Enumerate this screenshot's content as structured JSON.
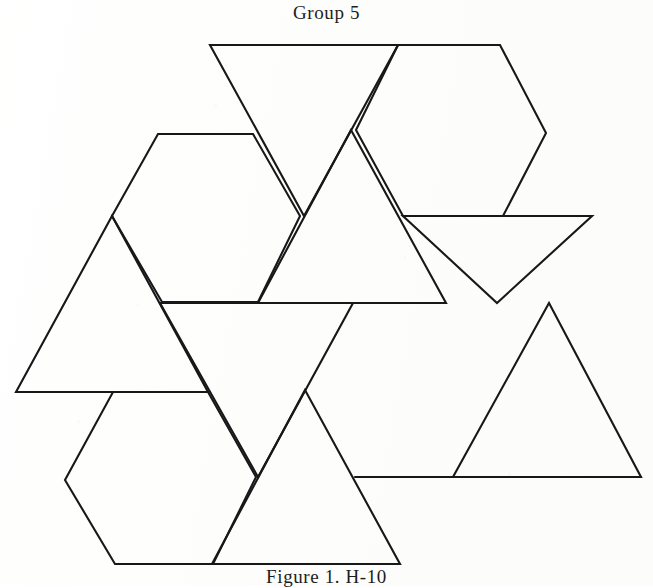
{
  "figure": {
    "title": "Group 5",
    "caption": "Figure 1. H-10",
    "caption_note": "caption clipped by bottom edge of page",
    "ink_color": "#18181a",
    "paper_color": "#fdfdfc"
  },
  "net": {
    "description": "polyhedron net of equilateral triangles and regular hexagons",
    "shape_counts": {
      "triangles": 7,
      "hexagons": 3
    },
    "faces": [
      {
        "name": "triangle-top-left-down",
        "kind": "triangle",
        "orientation": "down",
        "points": "210,45 398,45 304,216"
      },
      {
        "name": "hexagon-top-right",
        "kind": "hexagon",
        "points": "398,45 500,45 546,133 503,216 403,216 356,130"
      },
      {
        "name": "hexagon-left",
        "kind": "hexagon",
        "points": "158,134 253,134 300,216 258,302 162,302 112,216"
      },
      {
        "name": "triangle-left-up",
        "kind": "triangle",
        "orientation": "up",
        "points": "112,216 208,392 16,392"
      },
      {
        "name": "triangle-center-up",
        "kind": "triangle",
        "orientation": "up",
        "points": "351,130 446,303 258,303"
      },
      {
        "name": "triangle-right-down",
        "kind": "triangle",
        "orientation": "down",
        "points": "403,216 592,216 497,303"
      },
      {
        "name": "triangle-center-low-down",
        "kind": "triangle",
        "orientation": "down",
        "points": "160,303 353,303 258,477"
      },
      {
        "name": "triangle-right-low-up",
        "kind": "triangle",
        "orientation": "up",
        "points": "549,303 641,477 453,477"
      },
      {
        "name": "hexagon-bottom-left",
        "kind": "hexagon",
        "points": "113,392 208,392 256,477 213,564 115,564 65,480"
      },
      {
        "name": "triangle-bottom-center-up",
        "kind": "triangle",
        "orientation": "up",
        "points": "305,390 400,564 212,564"
      },
      {
        "name": "edge-bottom-right-rail",
        "kind": "edge",
        "points": "355,477 641,477"
      }
    ]
  }
}
